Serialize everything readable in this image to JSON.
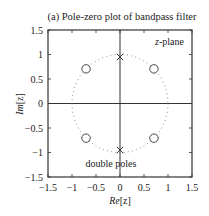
{
  "chart_data": {
    "type": "scatter",
    "title": "(a) Pole-zero plot of bandpass filter",
    "xlabel": "Re[z]",
    "ylabel": "Im[z]",
    "xlim": [
      -1.5,
      1.5
    ],
    "ylim": [
      -1.5,
      1.5
    ],
    "xticks": [
      -1.5,
      -1,
      -0.5,
      0,
      0.5,
      1,
      1.5
    ],
    "yticks": [
      -1.5,
      -1,
      -0.5,
      0,
      0.5,
      1,
      1.5
    ],
    "xtick_labels": [
      "−1.5",
      "−1",
      "−0.5",
      "0",
      "0.5",
      "1",
      "1.5"
    ],
    "ytick_labels": [
      "−1.5",
      "−1",
      "−0.5",
      "0",
      "0.5",
      "1",
      "1.5"
    ],
    "grid": false,
    "unit_circle": {
      "radius": 1,
      "style": "dotted"
    },
    "series": [
      {
        "name": "zeros",
        "marker": "o",
        "points": [
          {
            "re": -0.707,
            "im": 0.707
          },
          {
            "re": 0.707,
            "im": 0.707
          },
          {
            "re": -0.707,
            "im": -0.707
          },
          {
            "re": 0.707,
            "im": -0.707
          }
        ]
      },
      {
        "name": "poles",
        "marker": "x",
        "multiplicity": 2,
        "points": [
          {
            "re": 0,
            "im": 0.95
          },
          {
            "re": 0,
            "im": -0.95
          }
        ]
      }
    ],
    "annotations": [
      {
        "text": "z-plane",
        "re": 0.95,
        "im": 1.25
      },
      {
        "text": "double poles",
        "re": -0.25,
        "im": -1.2
      }
    ]
  },
  "labels": {
    "title": "(a) Pole-zero plot of bandpass filter",
    "xlabel_main": "Re",
    "xlabel_arg": "[z]",
    "ylabel_main": "Im",
    "ylabel_arg": "[z]",
    "zplane_var": "z",
    "zplane_rest": "-plane",
    "double_poles": "double poles"
  }
}
